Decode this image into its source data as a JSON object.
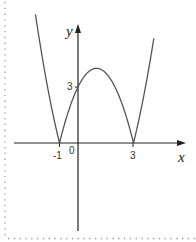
{
  "chart_data": {
    "type": "line",
    "title": "",
    "function": "y = |x^2 - 2x - 3|",
    "xlabel": "x",
    "ylabel": "y",
    "xlim": [
      -3.5,
      5.8
    ],
    "ylim": [
      -4.8,
      6.7
    ],
    "grid": false,
    "legend": null,
    "x_tick_labels": [
      {
        "value": -1,
        "label": "-1"
      },
      {
        "value": 0,
        "label": "0"
      },
      {
        "value": 3,
        "label": "3"
      }
    ],
    "y_tick_labels": [
      {
        "value": 3,
        "label": "3"
      }
    ],
    "key_points": [
      {
        "x": -1,
        "y": 0,
        "note": "x-intercept (cusp)"
      },
      {
        "x": 3,
        "y": 0,
        "note": "x-intercept (cusp)"
      },
      {
        "x": 0,
        "y": 3,
        "note": "y-intercept"
      },
      {
        "x": 1,
        "y": 4,
        "note": "local maximum"
      }
    ],
    "curve_x_range": [
      -2.3,
      4.1
    ],
    "series": [
      {
        "name": "|x^2-2x-3|",
        "x": [
          -2.3,
          -2.0,
          -1.5,
          -1.0,
          -0.5,
          0.0,
          0.5,
          1.0,
          1.5,
          2.0,
          2.5,
          3.0,
          3.5,
          4.0,
          4.1
        ],
        "values": [
          6.89,
          5.0,
          2.25,
          0.0,
          1.75,
          3.0,
          3.75,
          4.0,
          3.75,
          3.0,
          1.75,
          0.0,
          2.25,
          5.0,
          5.61
        ]
      }
    ]
  },
  "labels": {
    "y_axis": "y",
    "x_axis": "x",
    "origin": "0",
    "x_tick_neg1": "-1",
    "x_tick_3": "3",
    "y_tick_3": "3"
  },
  "style": {
    "curve_color": "#555555",
    "axis_color": "#222222",
    "border_color": "#9a9a9a"
  }
}
